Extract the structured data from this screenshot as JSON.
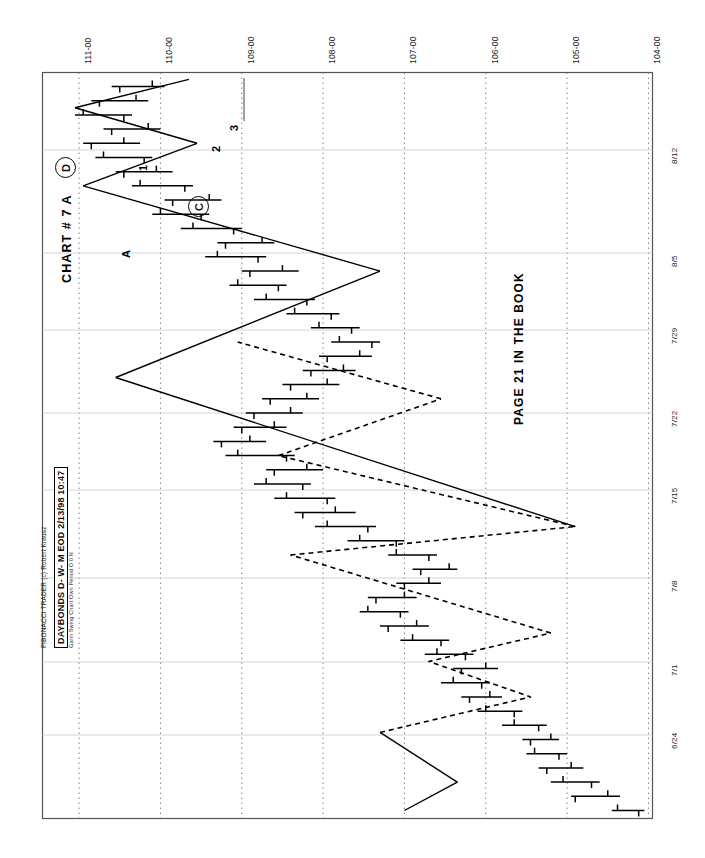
{
  "app": {
    "vendor_line": "FIBONACCI TRADER (c) Robert Krausz",
    "title_main": "DAYBONDS  D- W- M EOD   2/13/98  10:47",
    "title_sub": "Gann Swing Chart Own Period O 0 N"
  },
  "annotations": {
    "chart_title": "CHART # 7   A",
    "page_note": "PAGE 21 IN THE BOOK",
    "markers": [
      {
        "name": "marker-a",
        "label": "A",
        "circled": false,
        "x": 120,
        "y": 258
      },
      {
        "name": "marker-c",
        "label": "C",
        "circled": true,
        "x": 188,
        "y": 196
      },
      {
        "name": "marker-d",
        "label": "D",
        "circled": true,
        "x": 55,
        "y": 157
      },
      {
        "name": "swing-point-1",
        "label": "1",
        "circled": false,
        "x": 137,
        "y": 171
      },
      {
        "name": "swing-point-2",
        "label": "2",
        "circled": false,
        "x": 210,
        "y": 152
      },
      {
        "name": "swing-point-3",
        "label": "3",
        "circled": false,
        "x": 228,
        "y": 131
      }
    ]
  },
  "chart_data": {
    "type": "bar",
    "subtype": "ohlc-bar-with-gann-swing-overlay",
    "title": "DAYBONDS  D- W- M EOD   2/13/98  10:47",
    "xlabel": "",
    "ylabel": "",
    "orientation": "rotated-90-ccw",
    "grid": true,
    "legend": "none",
    "price_axis": {
      "name": "price",
      "ticks": [
        "111-00",
        "110-00",
        "109-00",
        "108-00",
        "107-00",
        "106-00",
        "105-00",
        "104-00"
      ],
      "values": [
        111.0,
        110.0,
        109.0,
        108.0,
        107.0,
        106.0,
        105.0,
        104.0
      ],
      "range": [
        104.0,
        111.0
      ]
    },
    "date_axis": {
      "name": "date",
      "ticks": [
        "8/12",
        "8/5",
        "7/29",
        "7/22",
        "7/15",
        "7/8",
        "7/1",
        "6/24"
      ],
      "range": [
        "6/17",
        "8/14"
      ]
    },
    "bars": [
      {
        "i": 0,
        "high": 104.45,
        "low": 104.05,
        "open": 104.12,
        "close": 104.38
      },
      {
        "i": 1,
        "high": 104.95,
        "low": 104.35,
        "open": 104.9,
        "close": 104.5
      },
      {
        "i": 2,
        "high": 105.2,
        "low": 104.6,
        "open": 104.7,
        "close": 105.05
      },
      {
        "i": 3,
        "high": 105.35,
        "low": 104.8,
        "open": 105.25,
        "close": 104.95
      },
      {
        "i": 4,
        "high": 105.5,
        "low": 105.0,
        "open": 105.1,
        "close": 105.4
      },
      {
        "i": 5,
        "high": 105.55,
        "low": 105.1,
        "open": 105.45,
        "close": 105.2
      },
      {
        "i": 6,
        "high": 105.8,
        "low": 105.25,
        "open": 105.35,
        "close": 105.65
      },
      {
        "i": 7,
        "high": 106.1,
        "low": 105.55,
        "open": 105.65,
        "close": 106.0
      },
      {
        "i": 8,
        "high": 106.3,
        "low": 105.8,
        "open": 106.2,
        "close": 105.95
      },
      {
        "i": 9,
        "high": 106.55,
        "low": 105.95,
        "open": 106.05,
        "close": 106.4
      },
      {
        "i": 10,
        "high": 106.4,
        "low": 105.85,
        "open": 106.3,
        "close": 106.0
      },
      {
        "i": 11,
        "high": 106.75,
        "low": 106.15,
        "open": 106.25,
        "close": 106.6
      },
      {
        "i": 12,
        "high": 107.05,
        "low": 106.45,
        "open": 106.55,
        "close": 106.9
      },
      {
        "i": 13,
        "high": 107.3,
        "low": 106.7,
        "open": 107.2,
        "close": 106.85
      },
      {
        "i": 14,
        "high": 107.55,
        "low": 106.95,
        "open": 107.05,
        "close": 107.45
      },
      {
        "i": 15,
        "high": 107.45,
        "low": 106.85,
        "open": 107.35,
        "close": 107.0
      },
      {
        "i": 16,
        "high": 107.1,
        "low": 106.55,
        "open": 107.0,
        "close": 106.7
      },
      {
        "i": 17,
        "high": 106.9,
        "low": 106.35,
        "open": 106.8,
        "close": 106.45
      },
      {
        "i": 18,
        "high": 107.2,
        "low": 106.6,
        "open": 106.7,
        "close": 107.1
      },
      {
        "i": 19,
        "high": 107.7,
        "low": 107.0,
        "open": 107.1,
        "close": 107.55
      },
      {
        "i": 20,
        "high": 108.1,
        "low": 107.35,
        "open": 107.45,
        "close": 107.95
      },
      {
        "i": 21,
        "high": 108.35,
        "low": 107.6,
        "open": 108.25,
        "close": 107.85
      },
      {
        "i": 22,
        "high": 108.6,
        "low": 107.85,
        "open": 107.95,
        "close": 108.45
      },
      {
        "i": 23,
        "high": 108.85,
        "low": 108.15,
        "open": 108.25,
        "close": 108.7
      },
      {
        "i": 24,
        "high": 108.7,
        "low": 108.0,
        "open": 108.6,
        "close": 108.2
      },
      {
        "i": 25,
        "high": 109.2,
        "low": 108.35,
        "open": 108.45,
        "close": 109.05
      },
      {
        "i": 26,
        "high": 109.35,
        "low": 108.7,
        "open": 109.25,
        "close": 108.9
      },
      {
        "i": 27,
        "high": 109.1,
        "low": 108.45,
        "open": 109.0,
        "close": 108.6
      },
      {
        "i": 28,
        "high": 108.95,
        "low": 108.25,
        "open": 108.85,
        "close": 108.4
      },
      {
        "i": 29,
        "high": 108.75,
        "low": 108.05,
        "open": 108.65,
        "close": 108.2
      },
      {
        "i": 30,
        "high": 108.5,
        "low": 107.8,
        "open": 108.4,
        "close": 107.95
      },
      {
        "i": 31,
        "high": 108.25,
        "low": 107.6,
        "open": 108.15,
        "close": 107.75
      },
      {
        "i": 32,
        "high": 108.05,
        "low": 107.4,
        "open": 107.95,
        "close": 107.55
      },
      {
        "i": 33,
        "high": 107.9,
        "low": 107.3,
        "open": 107.4,
        "close": 107.8
      },
      {
        "i": 34,
        "high": 108.15,
        "low": 107.55,
        "open": 107.65,
        "close": 108.05
      },
      {
        "i": 35,
        "high": 108.45,
        "low": 107.8,
        "open": 107.9,
        "close": 108.35
      },
      {
        "i": 36,
        "high": 108.85,
        "low": 108.1,
        "open": 108.2,
        "close": 108.7
      },
      {
        "i": 37,
        "high": 109.15,
        "low": 108.45,
        "open": 108.55,
        "close": 109.05
      },
      {
        "i": 38,
        "high": 109.0,
        "low": 108.3,
        "open": 108.9,
        "close": 108.5
      },
      {
        "i": 39,
        "high": 109.45,
        "low": 108.7,
        "open": 108.8,
        "close": 109.3
      },
      {
        "i": 40,
        "high": 109.3,
        "low": 108.6,
        "open": 109.2,
        "close": 108.75
      },
      {
        "i": 41,
        "high": 109.75,
        "low": 109.0,
        "open": 109.1,
        "close": 109.6
      },
      {
        "i": 42,
        "high": 110.1,
        "low": 109.4,
        "open": 109.5,
        "close": 110.0
      },
      {
        "i": 43,
        "high": 109.95,
        "low": 109.25,
        "open": 109.85,
        "close": 109.4
      },
      {
        "i": 44,
        "high": 110.35,
        "low": 109.6,
        "open": 109.7,
        "close": 110.25
      },
      {
        "i": 45,
        "high": 110.55,
        "low": 109.85,
        "open": 110.45,
        "close": 110.05
      },
      {
        "i": 46,
        "high": 110.8,
        "low": 110.1,
        "open": 110.2,
        "close": 110.7
      },
      {
        "i": 47,
        "high": 110.95,
        "low": 110.25,
        "open": 110.85,
        "close": 110.45
      },
      {
        "i": 48,
        "high": 110.7,
        "low": 110.0,
        "open": 110.6,
        "close": 110.15
      },
      {
        "i": 49,
        "high": 111.05,
        "low": 110.35,
        "open": 110.45,
        "close": 110.95
      },
      {
        "i": 50,
        "high": 110.85,
        "low": 110.15,
        "open": 110.75,
        "close": 110.3
      },
      {
        "i": 51,
        "high": 110.6,
        "low": 109.95,
        "open": 110.5,
        "close": 110.1
      }
    ],
    "swing_line": {
      "name": "gann-swing-line",
      "solid_segments": [
        [
          [
            107.0,
            0.0
          ],
          [
            106.35,
            2.0
          ],
          [
            107.3,
            5.5
          ]
        ],
        [
          [
            104.9,
            20.0
          ],
          [
            110.55,
            30.5
          ]
        ],
        [
          [
            110.55,
            30.5
          ],
          [
            107.3,
            38.0
          ]
        ],
        [
          [
            107.3,
            38.0
          ],
          [
            110.95,
            44.0
          ]
        ],
        [
          [
            110.95,
            44.0
          ],
          [
            109.55,
            47.0
          ]
        ],
        [
          [
            109.55,
            47.0
          ],
          [
            111.05,
            49.5
          ]
        ],
        [
          [
            111.05,
            49.5
          ],
          [
            109.65,
            51.5
          ]
        ]
      ],
      "dashed_segments": [
        [
          [
            107.3,
            5.5
          ],
          [
            105.45,
            8.0
          ],
          [
            106.7,
            10.5
          ],
          [
            105.2,
            12.5
          ]
        ],
        [
          [
            105.2,
            12.5
          ],
          [
            108.4,
            18.0
          ]
        ],
        [
          [
            108.4,
            18.0
          ],
          [
            104.9,
            20.0
          ]
        ],
        [
          [
            104.9,
            20.0
          ],
          [
            108.55,
            25.0
          ]
        ],
        [
          [
            108.55,
            25.0
          ],
          [
            106.55,
            29.0
          ]
        ],
        [
          [
            106.55,
            29.0
          ],
          [
            109.05,
            33.0
          ]
        ]
      ]
    }
  }
}
